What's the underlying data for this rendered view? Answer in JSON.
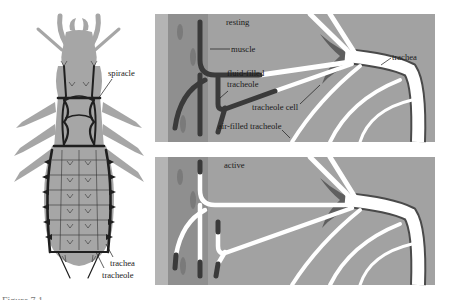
{
  "figure": {
    "caption_partial": "Figure 7.1",
    "colors": {
      "background": "#ffffff",
      "body_gray": "#a6a6a6",
      "panel_gray": "#a2a2a2",
      "panel_edge_strip": "#b4b4b4",
      "muscle_band": "#8f8f8f",
      "fluid_dark": "#3a3a3a",
      "air_white": "#ffffff",
      "tracheole_cell": "#5f5f5f",
      "trachea_outline": "#4a4a4a"
    }
  },
  "insect_panel": {
    "labels": {
      "spiracle": "spiracle",
      "trachea": "trachea",
      "tracheole": "tracheole"
    }
  },
  "resting_panel": {
    "title": "resting",
    "labels": {
      "muscle": "muscle",
      "fluid_filled_1": "fluid-filled",
      "fluid_filled_2": "tracheole",
      "tracheole_cell": "tracheole cell",
      "air_filled": "air-filled tracheole",
      "trachea": "trachea"
    }
  },
  "active_panel": {
    "title": "active"
  }
}
